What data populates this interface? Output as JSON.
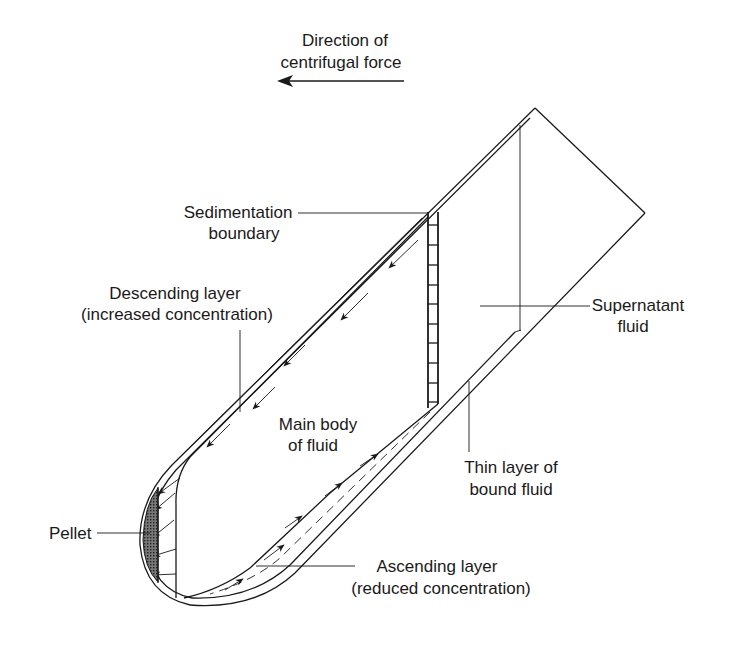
{
  "diagram": {
    "title_line1": "Direction of",
    "title_line2": "centrifugal force",
    "labels": {
      "sedimentation_boundary_1": "Sedimentation",
      "sedimentation_boundary_2": "boundary",
      "descending_layer_1": "Descending layer",
      "descending_layer_2": "(increased concentration)",
      "supernatant_1": "Supernatant",
      "supernatant_2": "fluid",
      "main_body_1": "Main body",
      "main_body_2": "of fluid",
      "thin_layer_1": "Thin layer of",
      "thin_layer_2": "bound fluid",
      "pellet": "Pellet",
      "ascending_layer_1": "Ascending layer",
      "ascending_layer_2": "(reduced concentration)"
    },
    "colors": {
      "line": "#1a1a1a",
      "pellet_fill": "#555555",
      "background": "#ffffff"
    },
    "icons": [
      "arrow-left-icon",
      "flow-arrow-icon"
    ]
  }
}
